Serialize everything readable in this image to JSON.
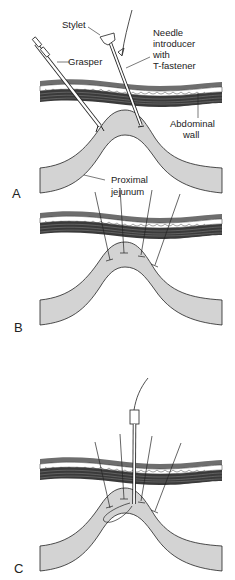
{
  "figure": {
    "panels": [
      {
        "id": "A",
        "label": "A",
        "annotations": {
          "stylet": "Stylet",
          "grasper": "Grasper",
          "needle_line1": "Needle",
          "needle_line2": "introducer",
          "needle_line3": "with",
          "needle_line4": "T-fastener",
          "abdominal_line1": "Abdominal",
          "abdominal_line2": "wall",
          "jejunum_line1": "Proximal",
          "jejunum_line2": "jejunum"
        }
      },
      {
        "id": "B",
        "label": "B"
      },
      {
        "id": "C",
        "label": "C"
      }
    ],
    "colors": {
      "bowel_fill": "#d3d3d3",
      "wall_skin": "#6e6e6e",
      "wall_muscle": "#3a3a3a",
      "outline": "#222222"
    }
  }
}
